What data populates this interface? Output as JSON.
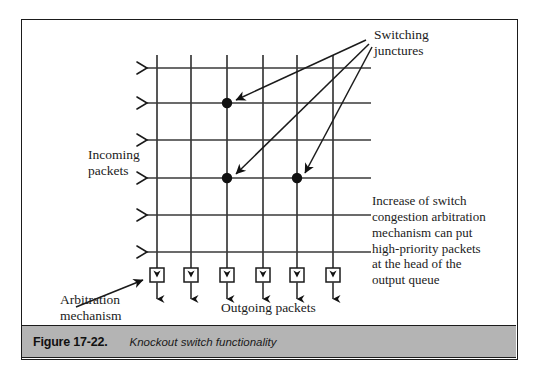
{
  "figure": {
    "caption_number": "Figure 17-22.",
    "caption_title": "Knockout switch functionality",
    "caption_bar_color": "#b4b4b4",
    "frame_color": "#1b1b1b",
    "background_color": "#ffffff"
  },
  "labels": {
    "switching_junctures": "Switching\njunctures",
    "incoming_packets": "Incoming\npackets",
    "outgoing_packets": "Outgoing packets",
    "arbitration_mechanism": "Arbitration\nmechanism",
    "congestion_note": "Increase of switch\ncongestion arbitration\nmechanism can put\nhigh-priority packets\nat the head of the\noutput queue"
  },
  "diagram": {
    "type": "crossbar-switch-fabric",
    "line_color": "#3a3a3a",
    "marker_color": "#111111",
    "input_line_count": 6,
    "output_line_count": 6,
    "input_line_y": [
      49,
      84,
      121,
      159,
      196,
      233
    ],
    "output_line_x": [
      136,
      170,
      206,
      242,
      276,
      312
    ],
    "grid_left_x": 124,
    "grid_right_x": 350,
    "grid_bottom_y": 262,
    "switching_junctures": [
      {
        "x": 206,
        "y": 84
      },
      {
        "x": 206,
        "y": 159
      },
      {
        "x": 276,
        "y": 159
      }
    ],
    "junction_arrow_origin": {
      "x": 345,
      "y": 21
    },
    "arbitration_boxes": [
      {
        "x": 136,
        "y": 256
      },
      {
        "x": 170,
        "y": 256
      },
      {
        "x": 206,
        "y": 256
      },
      {
        "x": 242,
        "y": 256
      },
      {
        "x": 276,
        "y": 256
      },
      {
        "x": 312,
        "y": 256
      }
    ],
    "arbitration_pointer": {
      "from_x": 55,
      "from_y": 288,
      "to_x": 124,
      "to_y": 261
    },
    "input_arrowheads": "chevron-right",
    "output_arrowheads": "arrow-down"
  }
}
